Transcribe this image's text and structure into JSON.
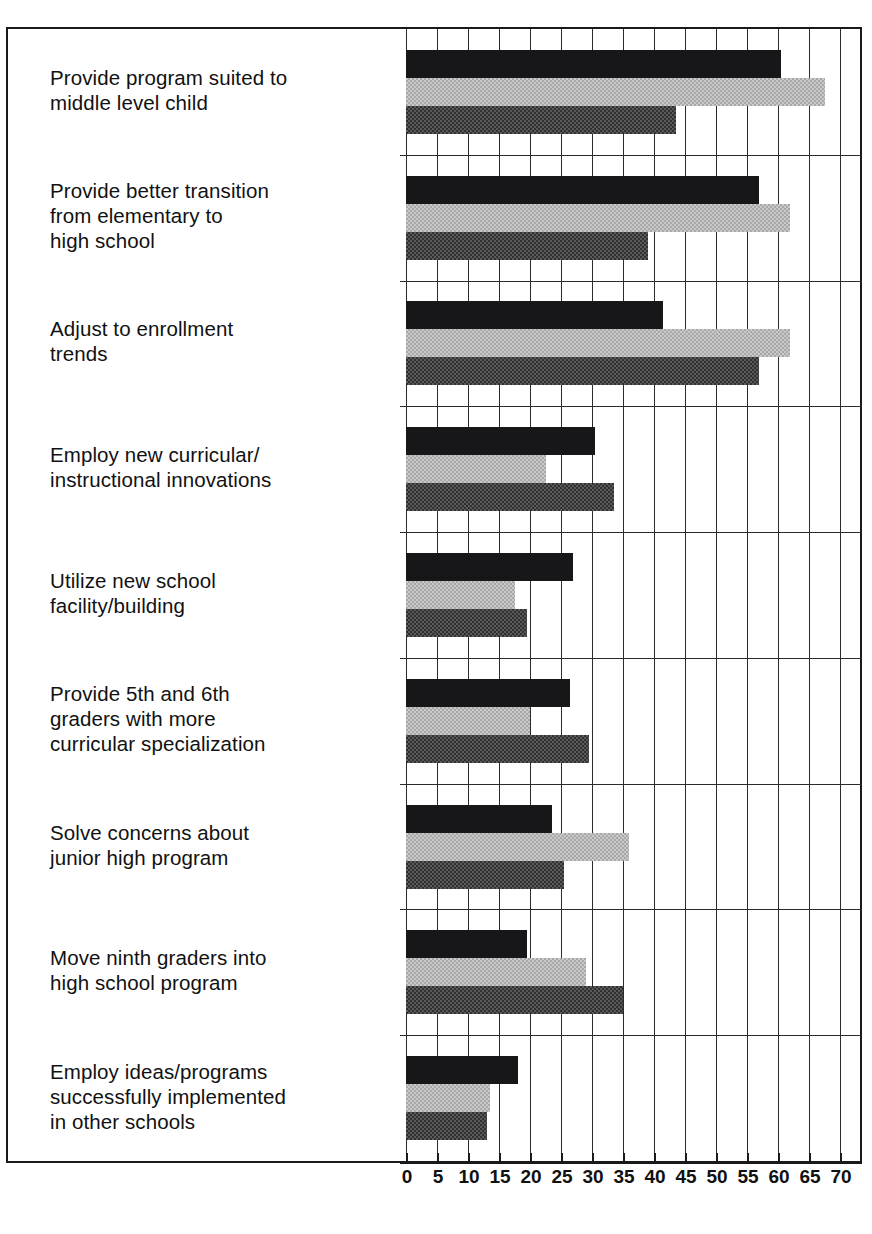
{
  "chart": {
    "type": "bar",
    "orientation": "horizontal",
    "grouped": true
  },
  "axis": {
    "tick_labels": [
      "0",
      "5",
      "10",
      "15",
      "20",
      "25",
      "30",
      "35",
      "40",
      "45",
      "50",
      "55",
      "60",
      "65",
      "70"
    ],
    "min": 0,
    "max": 70,
    "step": 5
  },
  "categories": [
    "Provide program suited to\nmiddle level child",
    "Provide better transition\nfrom elementary to\nhigh school",
    "Adjust to enrollment\ntrends",
    "Employ new curricular/\ninstructional innovations",
    "Utilize new school\nfacility/building",
    "Provide 5th and 6th\ngraders with more\ncurricular specialization",
    "Solve concerns about\njunior high program",
    "Move ninth graders into\nhigh school program",
    "Employ ideas/programs\nsuccessfully implemented\nin other schools"
  ],
  "colors": {
    "series_black": "#17171a",
    "series_light": "#c9c9c9",
    "series_dark": "#5a5a5a",
    "frame": "#1a1a1a",
    "grid": "#2b2b2b"
  },
  "chart_data": {
    "type": "bar",
    "title": "",
    "subtitle": "",
    "xlabel": "",
    "ylabel": "",
    "orientation": "horizontal",
    "grid": true,
    "legend": "none",
    "xlim": [
      0,
      70
    ],
    "xticks": [
      0,
      5,
      10,
      15,
      20,
      25,
      30,
      35,
      40,
      45,
      50,
      55,
      60,
      65,
      70
    ],
    "categories": [
      "Provide program suited to middle level child",
      "Provide better transition from elementary to high school",
      "Adjust to enrollment trends",
      "Employ new curricular/instructional innovations",
      "Utilize new school facility/building",
      "Provide 5th and 6th graders with more curricular specialization",
      "Solve concerns about junior high program",
      "Move ninth graders into high school program",
      "Employ ideas/programs successfully implemented in other schools"
    ],
    "series": [
      {
        "name": "series-1",
        "color": "#17171a",
        "values": [
          60.5,
          57.0,
          41.5,
          30.5,
          27.0,
          26.5,
          23.5,
          19.5,
          18.0
        ]
      },
      {
        "name": "series-2",
        "color": "#c9c9c9",
        "values": [
          67.5,
          62.0,
          62.0,
          22.5,
          17.5,
          20.0,
          36.0,
          29.0,
          13.5
        ]
      },
      {
        "name": "series-3",
        "color": "#5a5a5a",
        "values": [
          43.5,
          39.0,
          57.0,
          33.5,
          19.5,
          29.5,
          25.5,
          35.0,
          13.0
        ]
      }
    ]
  }
}
